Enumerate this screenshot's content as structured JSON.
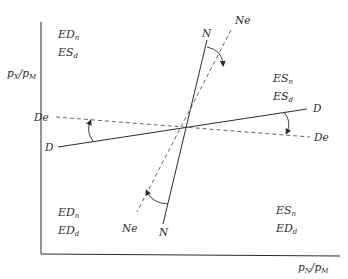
{
  "diagram": {
    "type": "phase-diagram",
    "axes": {
      "y_label": {
        "main": "p",
        "sub1": "X",
        "sep": "/",
        "main2": "p",
        "sub2": "M"
      },
      "x_label": {
        "main": "p",
        "sub1": "N",
        "sep": "/",
        "main2": "p",
        "sub2": "M"
      }
    },
    "lines": {
      "N": {
        "label": "N",
        "style": "solid"
      },
      "Ne": {
        "label": "Ne",
        "style": "dashed"
      },
      "D": {
        "label": "D",
        "style": "solid"
      },
      "De": {
        "label": "De",
        "style": "dashed"
      }
    },
    "quadrants": {
      "top_left": {
        "line1": {
          "base": "ED",
          "sub": "n"
        },
        "line2": {
          "base": "ES",
          "sub": "d"
        }
      },
      "top_right": {
        "line1": {
          "base": "ES",
          "sub": "n"
        },
        "line2": {
          "base": "ES",
          "sub": "d"
        }
      },
      "bottom_left": {
        "line1": {
          "base": "ED",
          "sub": "n"
        },
        "line2": {
          "base": "ED",
          "sub": "d"
        }
      },
      "bottom_right": {
        "line1": {
          "base": "ES",
          "sub": "n"
        },
        "line2": {
          "base": "ED",
          "sub": "d"
        }
      }
    },
    "colors": {
      "ink": "#2b2b2b",
      "dash": "#555555",
      "background": "#ffffff"
    }
  }
}
